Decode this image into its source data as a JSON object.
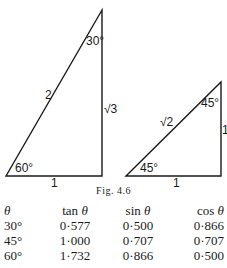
{
  "figure": {
    "caption": "Fig. 4.6",
    "triangle_30_60_90": {
      "hypotenuse_label": "2",
      "vertical_side_label": "√3",
      "base_label": "1",
      "top_angle_label": "30°",
      "bottom_angle_label": "60°"
    },
    "triangle_45_45_90": {
      "hypotenuse_label": "√2",
      "vertical_side_label": "1",
      "base_label": "1",
      "top_angle_label": "45°",
      "bottom_angle_label": "45°"
    }
  },
  "table": {
    "headers": {
      "theta_symbol": "θ",
      "tan": "tan",
      "sin": "sin",
      "cos": "cos",
      "theta": "θ"
    },
    "rows": [
      {
        "angle": "30°",
        "tan": "0·577",
        "sin": "0·500",
        "cos": "0·866"
      },
      {
        "angle": "45°",
        "tan": "1·000",
        "sin": "0·707",
        "cos": "0·707"
      },
      {
        "angle": "60°",
        "tan": "1·732",
        "sin": "0·866",
        "cos": "0·500"
      }
    ]
  }
}
